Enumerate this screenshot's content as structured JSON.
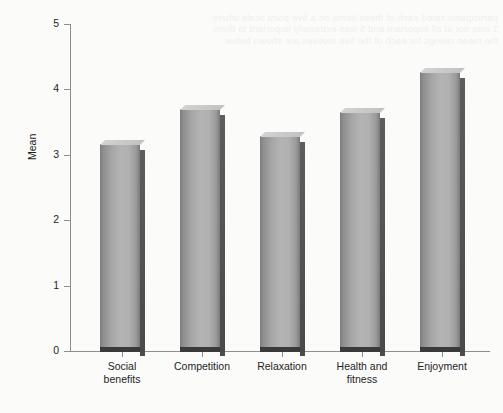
{
  "chart_data": {
    "type": "bar",
    "title": "",
    "subtitle": "",
    "xlabel": "",
    "ylabel": "Mean",
    "categories": [
      "Social benefits",
      "Competition",
      "Relaxation",
      "Health and fitness",
      "Enjoyment"
    ],
    "category_lines": [
      [
        "Social",
        "benefits"
      ],
      [
        "Competition",
        ""
      ],
      [
        "Relaxation",
        ""
      ],
      [
        "Health and",
        "fitness"
      ],
      [
        "Enjoyment",
        ""
      ]
    ],
    "values": [
      3.15,
      3.68,
      3.27,
      3.64,
      4.25
    ],
    "ylim": [
      0,
      5
    ],
    "yticks": [
      0,
      1,
      2,
      3,
      4,
      5
    ],
    "ytick_labels": [
      "0",
      "1",
      "2",
      "3",
      "4",
      "5"
    ],
    "grid": false,
    "legend": "none",
    "bar_color": "#a8a8a8",
    "bar_edge_color": "#6f6f6f",
    "axis_color": "#8d8d8d",
    "background_color": "#fbfbfa"
  },
  "background_artifact": {
    "note": "faint reverse-side print bleed-through, illegible",
    "lines": [
      "participants rated each of these items on a five point scale where",
      "1 was not at all important and 5 was extremely important to them",
      "the mean ratings for each of the five motives are shown below"
    ]
  }
}
